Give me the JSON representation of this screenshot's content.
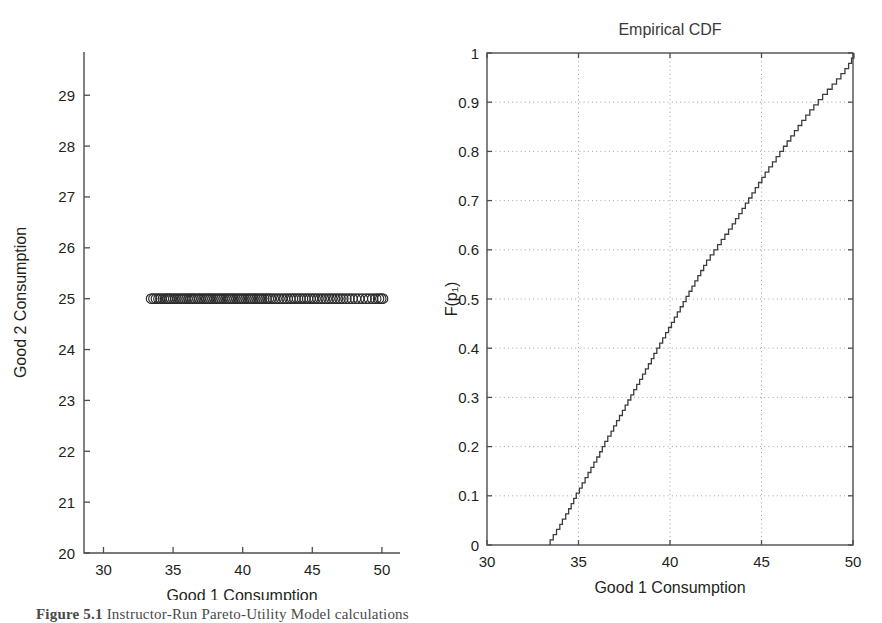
{
  "figure": {
    "caption_prefix": "Figure 5.1",
    "caption_rest": "  Instructor-Run Pareto-Utility Model calculations"
  },
  "chart_data": [
    {
      "id": "scatter-consumption",
      "type": "scatter",
      "title": "",
      "xlabel": "Good 1 Consumption",
      "ylabel": "Good 2 Consumption",
      "xlim": [
        28.6,
        51.3
      ],
      "ylim": [
        20,
        29.85
      ],
      "xticks": [
        30,
        35,
        40,
        45,
        50
      ],
      "xtick_labels": [
        "30",
        "35",
        "40",
        "45",
        "50"
      ],
      "yticks": [
        20,
        21,
        22,
        23,
        24,
        25,
        26,
        27,
        28,
        29
      ],
      "ytick_labels": [
        "20",
        "21",
        "22",
        "23",
        "24",
        "25",
        "26",
        "27",
        "28",
        "29"
      ],
      "grid": false,
      "marker": "open-circle",
      "marker_size_px": 5.2,
      "y_constant": 25,
      "x": [
        33.45,
        33.62,
        33.8,
        33.98,
        34.12,
        34.3,
        34.46,
        34.6,
        34.74,
        34.88,
        35.05,
        35.2,
        35.36,
        35.52,
        35.68,
        35.84,
        36.0,
        36.16,
        36.3,
        36.44,
        36.6,
        36.78,
        36.92,
        37.08,
        37.24,
        37.4,
        37.55,
        37.7,
        37.86,
        38.02,
        38.18,
        38.34,
        38.5,
        38.66,
        38.82,
        38.98,
        39.12,
        39.28,
        39.44,
        39.6,
        39.76,
        39.92,
        40.08,
        40.24,
        40.4,
        40.56,
        40.72,
        40.88,
        41.04,
        41.2,
        41.36,
        41.52,
        41.68,
        41.84,
        42.0,
        42.2,
        42.4,
        42.6,
        42.8,
        43.0,
        43.2,
        43.4,
        43.58,
        43.76,
        43.94,
        44.12,
        44.3,
        44.48,
        44.66,
        44.84,
        45.02,
        45.2,
        45.4,
        45.6,
        45.8,
        46.0,
        46.2,
        46.4,
        46.6,
        46.8,
        47.0,
        47.2,
        47.42,
        47.64,
        47.86,
        48.1,
        48.34,
        48.6,
        48.86,
        49.1,
        49.34,
        49.56,
        49.76,
        49.92,
        50.05
      ]
    },
    {
      "id": "empirical-cdf",
      "type": "line",
      "title": "Empirical CDF",
      "xlabel": "Good 1 Consumption",
      "ylabel": "F(p₁)",
      "xlim": [
        30,
        50
      ],
      "ylim": [
        0,
        1
      ],
      "xticks": [
        30,
        35,
        40,
        45,
        50
      ],
      "xtick_labels": [
        "30",
        "35",
        "40",
        "45",
        "50"
      ],
      "yticks": [
        0,
        0.1,
        0.2,
        0.3,
        0.4,
        0.5,
        0.6,
        0.7,
        0.8,
        0.9,
        1
      ],
      "ytick_labels": [
        "0",
        "0.1",
        "0.2",
        "0.3",
        "0.4",
        "0.5",
        "0.6",
        "0.7",
        "0.8",
        "0.9",
        "1"
      ],
      "grid": true,
      "grid_style": "dotted",
      "step": "post",
      "x": [
        33.45,
        33.62,
        33.8,
        33.98,
        34.12,
        34.3,
        34.46,
        34.6,
        34.74,
        34.88,
        35.05,
        35.2,
        35.36,
        35.52,
        35.68,
        35.84,
        36.0,
        36.16,
        36.3,
        36.44,
        36.6,
        36.78,
        36.92,
        37.08,
        37.24,
        37.4,
        37.55,
        37.7,
        37.86,
        38.02,
        38.18,
        38.34,
        38.5,
        38.66,
        38.82,
        38.98,
        39.12,
        39.28,
        39.44,
        39.6,
        39.76,
        39.92,
        40.08,
        40.24,
        40.4,
        40.56,
        40.72,
        40.88,
        41.04,
        41.2,
        41.36,
        41.52,
        41.68,
        41.84,
        42.0,
        42.2,
        42.4,
        42.6,
        42.8,
        43.0,
        43.2,
        43.4,
        43.58,
        43.76,
        43.94,
        44.12,
        44.3,
        44.48,
        44.66,
        44.84,
        45.02,
        45.2,
        45.4,
        45.6,
        45.8,
        46.0,
        46.2,
        46.4,
        46.6,
        46.8,
        47.0,
        47.2,
        47.42,
        47.64,
        47.86,
        48.1,
        48.34,
        48.6,
        48.86,
        49.1,
        49.34,
        49.56,
        49.76,
        49.92,
        50.05
      ],
      "y": [
        0.0105,
        0.0211,
        0.0316,
        0.0421,
        0.0526,
        0.0632,
        0.0737,
        0.0842,
        0.0947,
        0.1053,
        0.1158,
        0.1263,
        0.1368,
        0.1474,
        0.1579,
        0.1684,
        0.1789,
        0.1895,
        0.2,
        0.2105,
        0.2211,
        0.2316,
        0.2421,
        0.2526,
        0.2632,
        0.2737,
        0.2842,
        0.2947,
        0.3053,
        0.3158,
        0.3263,
        0.3368,
        0.3474,
        0.3579,
        0.3684,
        0.3789,
        0.3895,
        0.4,
        0.4105,
        0.4211,
        0.4316,
        0.4421,
        0.4526,
        0.4632,
        0.4737,
        0.4842,
        0.4947,
        0.5053,
        0.5158,
        0.5263,
        0.5368,
        0.5474,
        0.5579,
        0.5684,
        0.5789,
        0.5895,
        0.6,
        0.6105,
        0.6211,
        0.6316,
        0.6421,
        0.6526,
        0.6632,
        0.6737,
        0.6842,
        0.6947,
        0.7053,
        0.7158,
        0.7263,
        0.7368,
        0.7474,
        0.7579,
        0.7684,
        0.7789,
        0.7895,
        0.8,
        0.8105,
        0.8211,
        0.8316,
        0.8421,
        0.8526,
        0.8632,
        0.8737,
        0.8842,
        0.8947,
        0.9053,
        0.9158,
        0.9263,
        0.9368,
        0.9474,
        0.9579,
        0.9684,
        0.9789,
        0.9895,
        1.0
      ]
    }
  ]
}
